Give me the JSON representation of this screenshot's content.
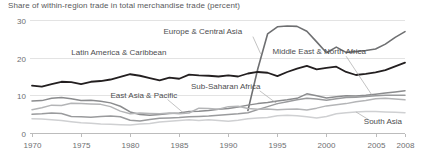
{
  "chart_data": {
    "type": "line",
    "title": "Share of within-region trade in total merchandise trade (percent)",
    "xlabel": "",
    "ylabel": "",
    "xlim": [
      1970,
      2008
    ],
    "ylim": [
      0,
      30
    ],
    "yticks": [
      0,
      10,
      20,
      30
    ],
    "ytick_labels": [
      "0",
      "10",
      "20",
      "30"
    ],
    "xticks": [
      1970,
      1975,
      1980,
      1985,
      1990,
      1995,
      2000,
      2005,
      2008
    ],
    "xtick_labels": [
      "1970",
      "1975",
      "1980",
      "1985",
      "1990",
      "1995",
      "2000",
      "2005",
      "2008"
    ],
    "grid": "horizontal",
    "legend": "inline-labels",
    "x": [
      1970,
      1971,
      1972,
      1973,
      1974,
      1975,
      1976,
      1977,
      1978,
      1979,
      1980,
      1981,
      1982,
      1983,
      1984,
      1985,
      1986,
      1987,
      1988,
      1989,
      1990,
      1991,
      1992,
      1993,
      1994,
      1995,
      1996,
      1997,
      1998,
      1999,
      2000,
      2001,
      2002,
      2003,
      2004,
      2005,
      2006,
      2007,
      2008
    ],
    "series": [
      {
        "name": "Europe & Central Asia",
        "color": "#6e6f71",
        "width": 1.6,
        "label_x": 1991.4,
        "label_y": 26.2,
        "label_anchor": "end",
        "start_year": 1992,
        "values": [
          null,
          null,
          null,
          null,
          null,
          null,
          null,
          null,
          null,
          null,
          null,
          null,
          null,
          null,
          null,
          null,
          null,
          null,
          null,
          null,
          null,
          null,
          6.0,
          17.0,
          26.3,
          28.2,
          28.4,
          28.3,
          27.0,
          24.2,
          21.3,
          22.8,
          21.4,
          21.6,
          21.9,
          22.3,
          23.6,
          25.4,
          26.9
        ]
      },
      {
        "name": "Latin America & Caribbean",
        "color": "#231f20",
        "width": 1.8,
        "label_x": 1974.0,
        "label_y": 20.6,
        "label_anchor": "start",
        "start_year": 1970,
        "values": [
          12.6,
          12.3,
          13.0,
          13.6,
          13.5,
          13.0,
          13.6,
          13.8,
          14.2,
          14.9,
          15.6,
          15.2,
          14.6,
          14.0,
          14.7,
          14.4,
          15.5,
          15.3,
          15.2,
          15.0,
          15.3,
          15.0,
          15.8,
          16.2,
          16.0,
          15.1,
          16.2,
          17.1,
          17.8,
          16.9,
          17.3,
          17.6,
          16.2,
          15.4,
          15.7,
          16.1,
          16.7,
          17.7,
          18.7
        ]
      },
      {
        "name": "Middle East & North Africa",
        "color": "#8b8c8e",
        "width": 1.5,
        "label_x": 1994.5,
        "label_y": 21.1,
        "label_anchor": "start",
        "start_year": 1970,
        "values": [
          8.5,
          8.6,
          9.2,
          9.4,
          9.1,
          8.6,
          8.7,
          8.4,
          8.0,
          7.1,
          5.6,
          4.9,
          4.7,
          4.9,
          5.2,
          5.3,
          5.7,
          5.8,
          6.0,
          6.3,
          6.5,
          6.9,
          7.4,
          7.8,
          8.1,
          8.5,
          8.8,
          9.2,
          10.4,
          9.9,
          9.3,
          9.6,
          9.9,
          9.8,
          10.0,
          10.3,
          10.6,
          10.9,
          11.2
        ]
      },
      {
        "name": "Sub-Saharan Africa",
        "color": "#9a9b9d",
        "width": 1.5,
        "label_x": 1986.2,
        "label_y": 11.7,
        "label_anchor": "start",
        "start_year": 1970,
        "values": [
          5.0,
          5.1,
          5.3,
          5.2,
          4.4,
          4.3,
          4.2,
          4.4,
          4.5,
          4.3,
          3.4,
          3.2,
          3.6,
          3.9,
          4.0,
          4.1,
          4.3,
          4.4,
          4.5,
          4.7,
          4.9,
          5.1,
          5.4,
          6.2,
          7.0,
          7.8,
          8.3,
          8.8,
          9.2,
          9.0,
          8.7,
          9.1,
          9.4,
          9.5,
          9.7,
          9.9,
          10.0,
          10.0,
          10.0
        ]
      },
      {
        "name": "East Asia & Pacific",
        "color": "#b4b5b7",
        "width": 1.5,
        "label_x": 1978.0,
        "label_y": 9.4,
        "label_anchor": "start",
        "start_year": 1970,
        "values": [
          6.2,
          6.7,
          7.4,
          7.3,
          7.9,
          7.8,
          7.7,
          7.6,
          7.0,
          5.8,
          5.1,
          5.3,
          5.2,
          5.1,
          5.3,
          5.1,
          5.3,
          6.6,
          6.5,
          6.3,
          7.0,
          7.1,
          6.5,
          6.3,
          6.4,
          6.2,
          6.3,
          6.4,
          6.1,
          6.6,
          7.2,
          7.5,
          7.8,
          8.3,
          8.6,
          9.1,
          9.2,
          9.0,
          8.8
        ]
      },
      {
        "name": "South Asia",
        "color": "#cfd0d2",
        "width": 1.5,
        "label_x": 2003.8,
        "label_y": 2.4,
        "label_anchor": "start",
        "start_year": 1970,
        "values": [
          3.8,
          3.7,
          3.5,
          3.3,
          3.0,
          2.7,
          2.6,
          2.4,
          2.3,
          2.2,
          2.1,
          2.4,
          2.5,
          2.9,
          3.1,
          3.3,
          3.5,
          3.3,
          3.5,
          3.3,
          3.1,
          3.4,
          3.8,
          4.0,
          4.1,
          4.6,
          4.7,
          4.6,
          4.3,
          4.0,
          4.4,
          5.1,
          5.4,
          5.6,
          5.7,
          5.7,
          5.6,
          5.5,
          5.4
        ]
      }
    ],
    "leader_lines": [
      {
        "name": "europe-leader",
        "x1": 1992.5,
        "y1": 25.6,
        "x2": 1993.3,
        "y2": 21.0
      },
      {
        "name": "middle-east-leader",
        "x1": 2002.0,
        "y1": 20.4,
        "x2": 2004.6,
        "y2": 10.2
      },
      {
        "name": "sub-saharan-leader",
        "x1": 1993.2,
        "y1": 11.2,
        "x2": 1995.0,
        "y2": 7.7
      },
      {
        "name": "east-asia-leader",
        "x1": 1983.8,
        "y1": 8.9,
        "x2": 1985.4,
        "y2": 5.4
      },
      {
        "name": "south-asia-leader",
        "x1": 2004.5,
        "y1": 3.2,
        "x2": 2003.0,
        "y2": 5.6
      }
    ]
  }
}
